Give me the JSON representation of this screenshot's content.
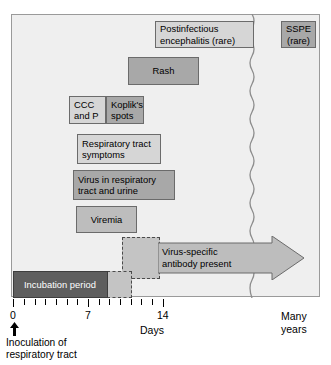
{
  "figure": {
    "type": "timeline",
    "axis": {
      "label": "Days",
      "tick_values": [
        0,
        1,
        2,
        3,
        4,
        5,
        6,
        7,
        8,
        9,
        10,
        11,
        12,
        13,
        14
      ],
      "labeled_ticks": [
        "0",
        "7",
        "14"
      ],
      "right_label_line1": "Many",
      "right_label_line2": "years",
      "break_marker": "wavy-line"
    },
    "start_marker": {
      "arrow": "up-arrow",
      "label_line1": "Inoculation of",
      "label_line2": "respiratory tract"
    },
    "events": [
      {
        "id": "postinfectious-encephalitis",
        "line1": "Postinfectious",
        "line2": "encephalitis (rare)",
        "shade": "light"
      },
      {
        "id": "sspe",
        "line1": "SSPE",
        "line2": "(rare)",
        "shade": "dark"
      },
      {
        "id": "rash",
        "line1": "Rash",
        "shade": "dark"
      },
      {
        "id": "ccc-and-p",
        "line1": "CCC",
        "line2": "and P",
        "shade": "light"
      },
      {
        "id": "kopliks-spots",
        "line1": "Koplik's",
        "line2": "spots",
        "shade": "dark"
      },
      {
        "id": "respiratory-tract-symptoms",
        "line1": "Respiratory tract",
        "line2": "symptoms",
        "shade": "light"
      },
      {
        "id": "virus-in-respiratory-tract-and-urine",
        "line1": "Virus in respiratory",
        "line2": "tract and urine",
        "shade": "dark"
      },
      {
        "id": "viremia",
        "line1": "Viremia",
        "shade": "mid"
      },
      {
        "id": "virus-specific-antibody",
        "line1": "Virus-specific",
        "line2": "antibody present",
        "shade": "mid"
      },
      {
        "id": "incubation-period",
        "line1": "Incubation period",
        "shade": "very-dark"
      }
    ],
    "colors": {
      "panel_background": "#efefef",
      "panel_border": "#9a9a9a",
      "block_light": "#d6d6d6",
      "block_mid": "#bdbdbd",
      "block_dark": "#a8a8a8",
      "block_very_dark": "#5e5e5e",
      "outline": "#6b6b6b",
      "text": "#000000"
    }
  }
}
